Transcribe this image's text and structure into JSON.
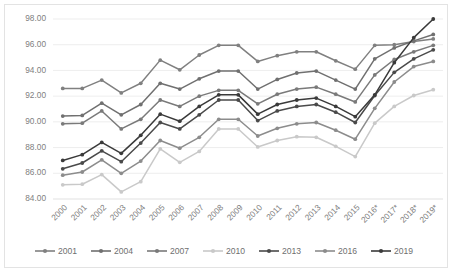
{
  "chart_data": {
    "type": "line",
    "title": "",
    "subtitle": "",
    "xlabel": "",
    "ylabel": "",
    "grid": true,
    "legend_position": "bottom",
    "ylim": [
      84.0,
      98.0
    ],
    "ytick_labels": [
      "84.00",
      "86.00",
      "88.00",
      "90.00",
      "92.00",
      "94.00",
      "96.00",
      "98.00"
    ],
    "ytick_values": [
      84.0,
      86.0,
      88.0,
      90.0,
      92.0,
      94.0,
      96.0,
      98.0
    ],
    "categories": [
      "2000",
      "2001",
      "2002",
      "2003",
      "2004",
      "2005",
      "2006",
      "2007",
      "2008",
      "2009",
      "2010",
      "2011",
      "2012",
      "2013",
      "2014",
      "2015",
      "2016*",
      "2017*",
      "2018*",
      "2019*"
    ],
    "series": [
      {
        "name": "2001",
        "color": "#808080",
        "values": [
          92.6,
          92.6,
          93.25,
          92.25,
          93.0,
          94.8,
          94.05,
          95.2,
          95.95,
          95.95,
          94.7,
          95.15,
          95.45,
          95.45,
          94.75,
          94.1,
          95.95,
          96.0,
          96.25,
          96.45
        ]
      },
      {
        "name": "2004",
        "color": "#707070",
        "values": [
          90.45,
          90.5,
          91.45,
          90.55,
          91.35,
          93.0,
          92.55,
          93.35,
          93.95,
          93.95,
          92.55,
          93.3,
          93.8,
          93.95,
          93.25,
          92.55,
          94.9,
          95.75,
          96.3,
          96.8
        ]
      },
      {
        "name": "2007",
        "color": "#7a7a7a",
        "values": [
          89.85,
          89.9,
          90.85,
          89.45,
          90.2,
          91.7,
          91.2,
          92.0,
          92.45,
          92.45,
          91.4,
          92.15,
          92.55,
          92.7,
          92.15,
          91.55,
          93.65,
          94.85,
          95.45,
          95.95
        ]
      },
      {
        "name": "2010",
        "color": "#c9c9c9",
        "values": [
          85.1,
          85.15,
          85.9,
          84.55,
          85.35,
          87.9,
          86.85,
          87.7,
          89.45,
          89.45,
          88.05,
          88.55,
          88.85,
          88.8,
          88.1,
          87.3,
          89.9,
          91.2,
          92.05,
          92.5
        ]
      },
      {
        "name": "2013",
        "color": "#4a4a4a",
        "values": [
          86.35,
          86.8,
          87.75,
          86.9,
          88.35,
          89.95,
          89.45,
          90.55,
          91.7,
          91.7,
          90.1,
          90.85,
          91.2,
          91.35,
          90.75,
          89.95,
          92.05,
          93.85,
          94.9,
          95.6
        ]
      },
      {
        "name": "2016",
        "color": "#8c8c8c",
        "values": [
          85.85,
          86.1,
          87.05,
          86.0,
          86.95,
          88.55,
          87.95,
          88.8,
          90.2,
          90.2,
          88.9,
          89.5,
          89.85,
          89.95,
          89.35,
          88.65,
          91.05,
          93.1,
          94.3,
          94.7
        ]
      },
      {
        "name": "2019",
        "color": "#3a3a3a",
        "values": [
          87.0,
          87.45,
          88.4,
          87.55,
          88.95,
          90.6,
          90.05,
          91.2,
          92.1,
          92.1,
          90.6,
          91.35,
          91.7,
          91.85,
          91.2,
          90.4,
          92.1,
          94.6,
          96.55,
          98.0
        ]
      }
    ]
  }
}
